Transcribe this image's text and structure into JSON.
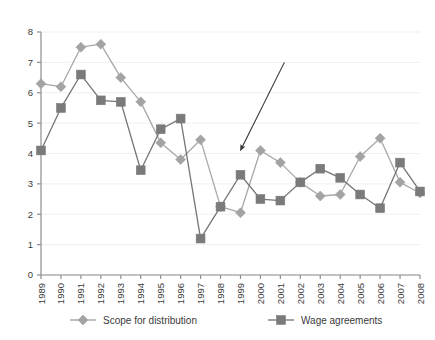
{
  "figure": {
    "top_cropped_caption": "",
    "background_color": "#ffffff"
  },
  "chart_data": {
    "type": "line",
    "title": "",
    "subtitle": "",
    "xlabel": "",
    "ylabel": "",
    "x": [
      1989,
      1990,
      1991,
      1992,
      1993,
      1994,
      1995,
      1996,
      1997,
      1998,
      1999,
      2000,
      2001,
      2002,
      2003,
      2004,
      2005,
      2006,
      2007,
      2008
    ],
    "categories": [
      "1989",
      "1990",
      "1991",
      "1992",
      "1993",
      "1994",
      "1995",
      "1996",
      "1997",
      "1998",
      "1999",
      "2000",
      "2001",
      "2002",
      "2003",
      "2004",
      "2005",
      "2006",
      "2007",
      "2008"
    ],
    "xlim": [
      1989,
      2008
    ],
    "ylim": [
      0,
      8
    ],
    "yticks": [
      0,
      1,
      2,
      3,
      4,
      5,
      6,
      7,
      8
    ],
    "ytick_labels": [
      "0",
      "1",
      "2",
      "3",
      "4",
      "5",
      "6",
      "7",
      "8"
    ],
    "grid": "horizontal",
    "legend_position": "bottom",
    "series": [
      {
        "name": "Scope for distribution",
        "color": "#a8a8a8",
        "marker": "diamond",
        "marker_color": "#a3a3a3",
        "values": [
          6.3,
          6.2,
          7.5,
          7.6,
          6.5,
          5.7,
          4.35,
          3.8,
          4.45,
          2.25,
          2.05,
          4.1,
          3.7,
          3.05,
          2.6,
          2.65,
          3.9,
          4.5,
          3.05,
          2.7
        ]
      },
      {
        "name": "Wage agreements",
        "color": "#757575",
        "marker": "square",
        "marker_color": "#7a7a7a",
        "values": [
          4.1,
          5.5,
          6.6,
          5.75,
          5.7,
          3.45,
          4.8,
          5.15,
          1.2,
          2.25,
          3.3,
          2.5,
          2.45,
          3.05,
          3.5,
          3.2,
          2.65,
          2.2,
          3.7,
          2.75
        ]
      }
    ],
    "annotations": [
      {
        "type": "arrow",
        "label": "",
        "from_x": 2001.2,
        "from_y": 7.0,
        "to_x": 1999.0,
        "to_y": 4.1,
        "color": "#333333"
      }
    ]
  },
  "legend": {
    "items": [
      {
        "label": "Scope for distribution",
        "marker": "diamond",
        "color": "#a3a3a3"
      },
      {
        "label": "Wage agreements",
        "marker": "square",
        "color": "#7a7a7a"
      }
    ]
  },
  "colors": {
    "axis": "#8d8d92",
    "gridline": "#efeff2",
    "text": "#3a3a3a",
    "series_light": "#a3a3a3",
    "series_dark": "#7a7a7a",
    "annotation": "#333333"
  }
}
